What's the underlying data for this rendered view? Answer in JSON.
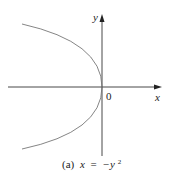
{
  "figure": {
    "caption_prefix": "(a)",
    "caption_equation_lhs": "x",
    "caption_equals": "=",
    "caption_equation_rhs": "−y",
    "caption_exponent": "2",
    "axes": {
      "x_label": "x",
      "y_label": "y",
      "origin_label": "0"
    },
    "curve": {
      "equation": "x = -y^2",
      "type": "parabola opening left",
      "vertex": [
        0,
        0
      ]
    },
    "colors": {
      "axis": "#333333",
      "curve": "#777777",
      "text": "#222222"
    }
  }
}
